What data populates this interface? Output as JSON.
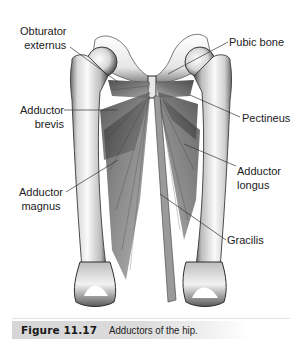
{
  "figure": {
    "number": "Figure 11.17",
    "caption": "Adductors of the hip."
  },
  "labels": {
    "obturator_externus": {
      "line1": "Obturator",
      "line2": "externus"
    },
    "pubic_bone": {
      "line1": "Pubic bone"
    },
    "adductor_brevis": {
      "line1": "Adductor",
      "line2": "brevis"
    },
    "pectineus": {
      "line1": "Pectineus"
    },
    "adductor_magnus": {
      "line1": "Adductor",
      "line2": "magnus"
    },
    "adductor_longus": {
      "line1": "Adductor",
      "line2": "longus"
    },
    "gracilis": {
      "line1": "Gracilis"
    }
  },
  "colors": {
    "bone_light": "#f4f4f4",
    "bone_shade": "#9a9a9a",
    "bone_dark": "#3a3a3a",
    "muscle_dark": "#4a4a4a",
    "muscle_mid": "#7a7a7a",
    "leader_line": "#333333",
    "caption_bg": "#d8d8d8"
  }
}
